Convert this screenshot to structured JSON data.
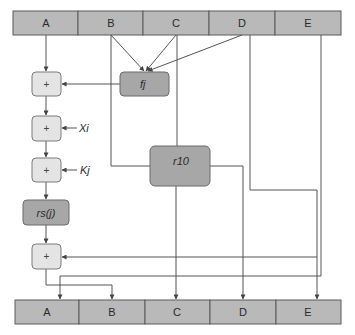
{
  "diagram": {
    "title": "",
    "input_registers": [
      "A",
      "B",
      "C",
      "D",
      "E"
    ],
    "output_registers": [
      "A",
      "B",
      "C",
      "D",
      "E"
    ],
    "operators": {
      "add1": "+",
      "add2": "+",
      "add3": "+",
      "add4": "+",
      "fj": "fj",
      "rs": "rs(j)",
      "r10": "r10"
    },
    "inputs": {
      "xi": "Xi",
      "kj": "Kj"
    },
    "colors": {
      "register_fill": "#b9b9b9",
      "light_op_fill": "#e4e4e4",
      "dark_op_fill": "#a7a7a7",
      "line": "#555555"
    }
  }
}
